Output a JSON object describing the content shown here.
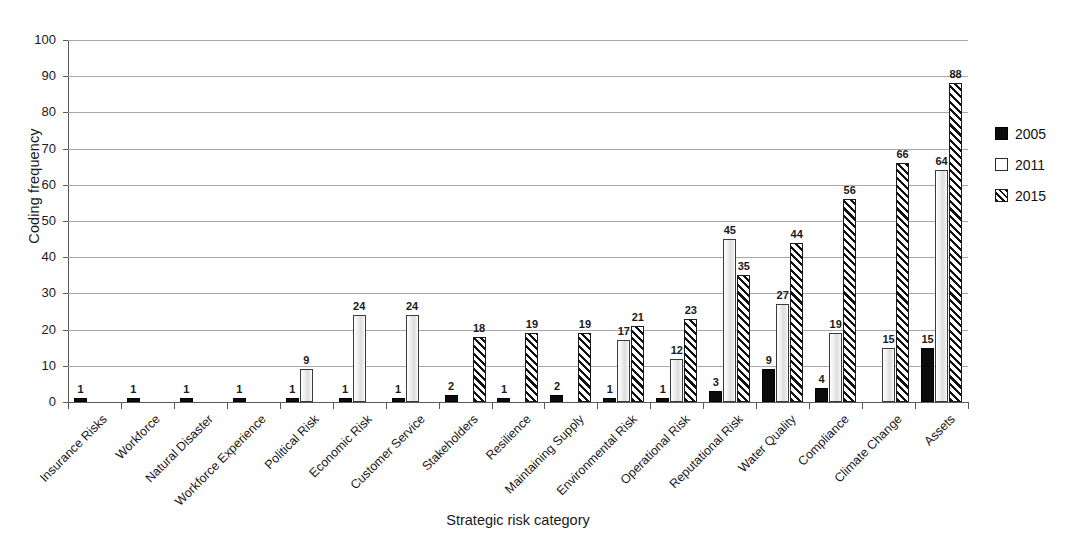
{
  "chart_data": {
    "type": "bar",
    "title": "",
    "xlabel": "Strategic risk category",
    "ylabel": "Coding frequency",
    "ylim": [
      0,
      100
    ],
    "yticks": [
      0,
      10,
      20,
      30,
      40,
      50,
      60,
      70,
      80,
      90,
      100
    ],
    "grid": true,
    "legend_position": "right",
    "categories": [
      "Insurance Risks",
      "Workforce",
      "Natural Disaster",
      "Workforce Experience",
      "Political Risk",
      "Economic Risk",
      "Customer Service",
      "Stakeholders",
      "Resilience",
      "Maintaining Supply",
      "Environmental Risk",
      "Operational Risk",
      "Reputational Risk",
      "Water Quality",
      "Compliance",
      "Climate Change",
      "Assets"
    ],
    "series": [
      {
        "name": "2005",
        "style": "solid-black",
        "color": "#0b0b0b",
        "values": [
          1,
          1,
          1,
          1,
          1,
          1,
          1,
          2,
          1,
          2,
          1,
          1,
          3,
          9,
          4,
          null,
          15
        ]
      },
      {
        "name": "2011",
        "style": "open-white",
        "color": "#ffffff",
        "values": [
          null,
          null,
          null,
          null,
          9,
          24,
          24,
          null,
          null,
          null,
          17,
          12,
          45,
          27,
          19,
          15,
          64
        ]
      },
      {
        "name": "2015",
        "style": "diagonal-hatch",
        "color": "#111111",
        "values": [
          null,
          null,
          null,
          null,
          null,
          null,
          null,
          18,
          19,
          19,
          21,
          23,
          35,
          44,
          56,
          66,
          88
        ]
      }
    ]
  },
  "legend": {
    "entries": [
      {
        "label": "2005"
      },
      {
        "label": "2011"
      },
      {
        "label": "2015"
      }
    ]
  },
  "axis": {
    "y_title": "Coding frequency",
    "x_title": "Strategic risk category"
  }
}
